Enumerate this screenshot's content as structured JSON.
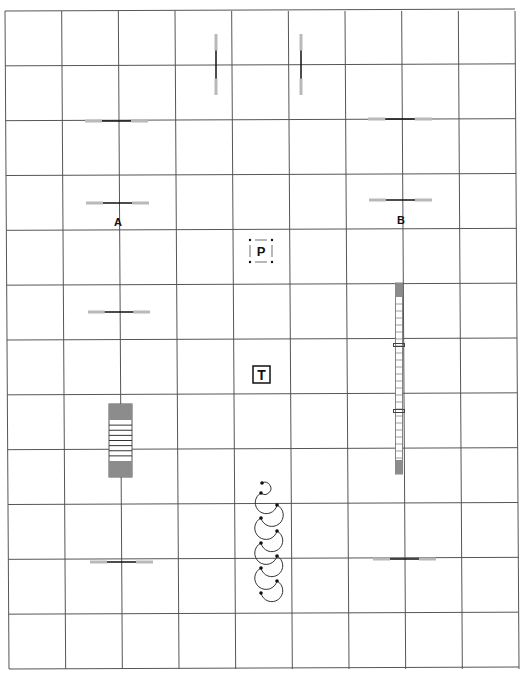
{
  "diagram": {
    "type": "agility-course-map",
    "colors": {
      "grid": "#555555",
      "bar": "#111111",
      "wing": "#b9b9b9",
      "contact": "#8c8c8c",
      "ink": "#111111"
    },
    "grid": {
      "left": 5,
      "top": 11,
      "right": 515,
      "bottom": 669,
      "columns": 9,
      "rows": 12
    },
    "labels": [
      {
        "id": "A",
        "text": "A",
        "x": 118,
        "y": 226
      },
      {
        "id": "B",
        "text": "B",
        "x": 401,
        "y": 224
      }
    ],
    "jumps": [
      {
        "orientation": "vertical",
        "x": 216,
        "y1": 34,
        "y2": 95
      },
      {
        "orientation": "vertical",
        "x": 301,
        "y1": 34,
        "y2": 95
      },
      {
        "orientation": "horizontal",
        "x1": 85,
        "x2": 148,
        "y": 121
      },
      {
        "orientation": "horizontal",
        "x1": 368,
        "x2": 432,
        "y": 119
      },
      {
        "orientation": "horizontal",
        "x1": 86,
        "x2": 149,
        "y": 203
      },
      {
        "orientation": "horizontal",
        "x1": 369,
        "x2": 432,
        "y": 200
      },
      {
        "orientation": "horizontal",
        "x1": 88,
        "x2": 150,
        "y": 312
      },
      {
        "orientation": "horizontal",
        "x1": 90,
        "x2": 153,
        "y": 562
      },
      {
        "orientation": "horizontal",
        "x1": 373,
        "x2": 436,
        "y": 559
      }
    ],
    "a_frame": {
      "x": 109,
      "y": 404,
      "width": 23,
      "height": 73,
      "contact_height": 16,
      "slats": 7
    },
    "dog_walk": {
      "x": 399,
      "y1": 283,
      "y2": 474,
      "width": 7,
      "contact_height": 14,
      "slat_spacing": 7,
      "supports_y": [
        345,
        411
      ]
    },
    "pause_box": {
      "text": "P",
      "x": 250,
      "y": 240,
      "size": 22
    },
    "table": {
      "text": "T",
      "x": 253,
      "y": 366,
      "size": 17
    },
    "coiled_tunnel": {
      "points": [
        [
          261,
          493
        ],
        [
          277,
          505
        ],
        [
          261,
          518
        ],
        [
          277,
          531
        ],
        [
          261,
          543
        ],
        [
          277,
          556
        ],
        [
          261,
          568
        ],
        [
          277,
          581
        ],
        [
          261,
          593
        ]
      ],
      "start": [
        262,
        483
      ]
    }
  }
}
